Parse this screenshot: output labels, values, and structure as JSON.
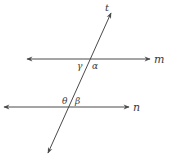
{
  "diagram": {
    "type": "parallel-lines-with-transversal",
    "colors": {
      "line": "#4a4a4a",
      "label": "#3a3a3a",
      "background": "#ffffff"
    },
    "lines": {
      "m": {
        "label": "m",
        "y": 59,
        "x1": 27,
        "x2": 150
      },
      "n": {
        "label": "n",
        "y": 107,
        "x1": 4,
        "x2": 129
      },
      "t": {
        "label": "t",
        "x1": 111,
        "y1": 13,
        "x2": 48,
        "y2": 153
      }
    },
    "angles": {
      "gamma": {
        "symbol": "γ",
        "position": "below-left of m∩t"
      },
      "alpha": {
        "symbol": "α",
        "position": "below-right of m∩t"
      },
      "theta": {
        "symbol": "θ",
        "position": "above-left of n∩t"
      },
      "beta": {
        "symbol": "β",
        "position": "above-right of n∩t"
      }
    }
  }
}
